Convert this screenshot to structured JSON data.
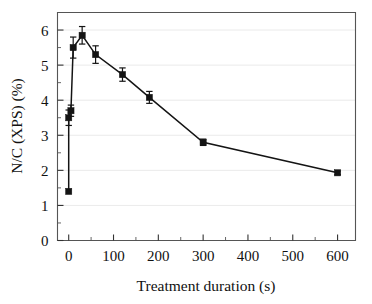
{
  "chart_data": {
    "type": "line",
    "title": "",
    "xlabel": "Treatment duration (s)",
    "ylabel": "N/C (XPS) (%)",
    "xlim": [
      -25,
      640
    ],
    "ylim": [
      0,
      6.5
    ],
    "xticks": [
      0,
      100,
      200,
      300,
      400,
      500,
      600
    ],
    "xtick_labels": [
      "0",
      "100",
      "200",
      "300",
      "400",
      "500",
      "600"
    ],
    "xminor_step": 50,
    "yticks": [
      0,
      1,
      2,
      3,
      4,
      5,
      6
    ],
    "ytick_labels": [
      "0",
      "1",
      "2",
      "3",
      "4",
      "5",
      "6"
    ],
    "yminor_step": 0.5,
    "grid": "horizontal-major",
    "legend": "none",
    "marker": "filled-square",
    "series": [
      {
        "name": "N/C ratio vs treatment duration",
        "x": [
          0,
          0,
          5,
          10,
          30,
          60,
          120,
          180,
          300,
          600
        ],
        "y": [
          1.4,
          3.5,
          3.7,
          5.5,
          5.85,
          5.3,
          4.73,
          4.08,
          2.8,
          1.93
        ],
        "yerr": [
          0.0,
          0.22,
          0.16,
          0.3,
          0.25,
          0.25,
          0.19,
          0.17,
          0.09,
          0.05
        ],
        "connected_from_index": 3
      }
    ]
  },
  "axes": {
    "x_axis_name": "treatment-duration-axis",
    "y_axis_name": "nc-xps-axis"
  }
}
